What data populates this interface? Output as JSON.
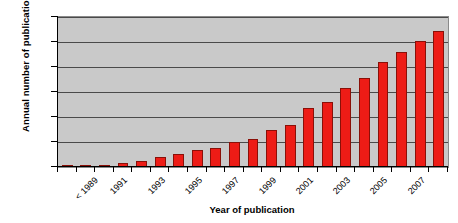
{
  "chart_data": {
    "type": "bar",
    "title": "",
    "xlabel": "Year of publication",
    "ylabel": "Annual number of publications",
    "categories": [
      "< 1989",
      "1990",
      "1991",
      "1992",
      "1993",
      "1994",
      "1995",
      "1996",
      "1997",
      "1998",
      "1999",
      "2000",
      "2001",
      "2002",
      "2003",
      "2004",
      "2005",
      "2006",
      "2007",
      "2008",
      "2009"
    ],
    "tick_labels": [
      "< 1989",
      "",
      "1991",
      "",
      "1993",
      "",
      "1995",
      "",
      "1997",
      "",
      "1999",
      "",
      "2001",
      "",
      "2003",
      "",
      "2005",
      "",
      "2007",
      "",
      ""
    ],
    "values": [
      3,
      3,
      8,
      15,
      25,
      42,
      53,
      68,
      75,
      100,
      112,
      148,
      168,
      238,
      262,
      318,
      355,
      420,
      460,
      505,
      545
    ],
    "ylim": [
      0,
      600
    ],
    "yticks": [
      0,
      100,
      200,
      300,
      400,
      500,
      600
    ],
    "ytick_labels": [
      "0",
      "100",
      "200",
      "300",
      "400",
      "500",
      "600"
    ],
    "grid": true,
    "legend": false,
    "bar_color": "#ED1C16",
    "plot_background": "#c9c9c9"
  }
}
